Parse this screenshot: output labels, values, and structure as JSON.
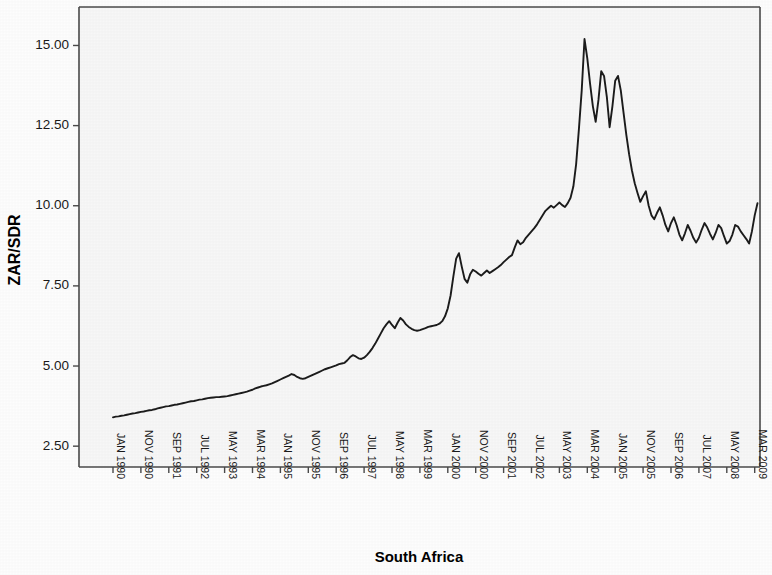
{
  "figure": {
    "background_color": "#fdfdfd",
    "plot_background_color": "#f7f7f7",
    "frame_color": "#4a4a4a",
    "line_color": "#1c1c1c"
  },
  "chart_data": {
    "type": "line",
    "title": "",
    "subtitle": "",
    "xlabel": "South Africa",
    "ylabel": "ZAR/SDR",
    "ylim": [
      1.85,
      16.2
    ],
    "ytick_values": [
      2.5,
      5.0,
      7.5,
      10.0,
      12.5,
      15.0
    ],
    "ytick_labels": [
      "2.50",
      "5.00",
      "7.50",
      "10.00",
      "12.50",
      "15.00"
    ],
    "grid": false,
    "legend": null,
    "legend_position": "none",
    "x_axis_type": "monthly-series",
    "x_tick_interval_months": 10,
    "xtick_labels": [
      "JAN 1990",
      "NOV 1990",
      "SEP 1991",
      "JUL 1992",
      "MAY 1993",
      "MAR 1994",
      "JAN 1995",
      "NOV 1995",
      "SEP 1996",
      "JUL 1997",
      "MAY 1998",
      "MAR 1999",
      "JAN 2000",
      "NOV 2000",
      "SEP 2001",
      "JUL 2002",
      "MAY 2003",
      "MAR 2004",
      "JAN 2005",
      "NOV 2005",
      "SEP 2006",
      "JUL 2007",
      "MAY 2008",
      "MAR 2009"
    ],
    "xtick_label_rotation_deg": 90,
    "series": [
      {
        "name": "ZAR/SDR",
        "start_period": "JAN 1990",
        "period_step_months": 1,
        "values": [
          3.4,
          3.42,
          3.43,
          3.45,
          3.46,
          3.48,
          3.5,
          3.52,
          3.53,
          3.55,
          3.57,
          3.58,
          3.6,
          3.62,
          3.63,
          3.65,
          3.68,
          3.7,
          3.72,
          3.74,
          3.75,
          3.77,
          3.79,
          3.8,
          3.82,
          3.84,
          3.86,
          3.88,
          3.9,
          3.91,
          3.93,
          3.95,
          3.96,
          3.98,
          4.0,
          4.01,
          4.02,
          4.03,
          4.03,
          4.04,
          4.05,
          4.06,
          4.08,
          4.1,
          4.12,
          4.14,
          4.16,
          4.18,
          4.2,
          4.23,
          4.26,
          4.3,
          4.33,
          4.36,
          4.38,
          4.4,
          4.43,
          4.46,
          4.5,
          4.54,
          4.58,
          4.62,
          4.66,
          4.7,
          4.75,
          4.72,
          4.66,
          4.62,
          4.6,
          4.62,
          4.66,
          4.7,
          4.74,
          4.78,
          4.82,
          4.86,
          4.9,
          4.93,
          4.96,
          4.99,
          5.02,
          5.06,
          5.08,
          5.1,
          5.18,
          5.28,
          5.34,
          5.3,
          5.24,
          5.22,
          5.26,
          5.34,
          5.44,
          5.56,
          5.7,
          5.86,
          6.02,
          6.18,
          6.3,
          6.4,
          6.28,
          6.18,
          6.35,
          6.5,
          6.42,
          6.3,
          6.22,
          6.16,
          6.12,
          6.1,
          6.12,
          6.15,
          6.18,
          6.22,
          6.24,
          6.26,
          6.28,
          6.32,
          6.4,
          6.55,
          6.8,
          7.2,
          7.8,
          8.35,
          8.52,
          8.1,
          7.72,
          7.6,
          7.86,
          8.0,
          7.95,
          7.88,
          7.82,
          7.9,
          7.98,
          7.9,
          7.96,
          8.02,
          8.08,
          8.15,
          8.24,
          8.32,
          8.4,
          8.46,
          8.7,
          8.92,
          8.8,
          8.86,
          9.0,
          9.1,
          9.2,
          9.3,
          9.42,
          9.56,
          9.7,
          9.84,
          9.92,
          10.0,
          9.94,
          10.02,
          10.1,
          10.02,
          9.96,
          10.08,
          10.25,
          10.6,
          11.3,
          12.4,
          13.6,
          15.2,
          14.6,
          13.8,
          13.1,
          12.62,
          13.3,
          14.2,
          14.05,
          13.4,
          12.45,
          13.1,
          13.9,
          14.05,
          13.6,
          12.9,
          12.2,
          11.6,
          11.1,
          10.7,
          10.4,
          10.12,
          10.3,
          10.45,
          10.0,
          9.7,
          9.58,
          9.78,
          9.95,
          9.7,
          9.4,
          9.2,
          9.46,
          9.64,
          9.4,
          9.1,
          8.92,
          9.14,
          9.4,
          9.22,
          9.0,
          8.85,
          9.0,
          9.25,
          9.46,
          9.32,
          9.12,
          8.95,
          9.15,
          9.4,
          9.3,
          9.05,
          8.82,
          8.9,
          9.1,
          9.4,
          9.35,
          9.2,
          9.08,
          8.96,
          8.82,
          9.2,
          9.7,
          10.08,
          10.25,
          9.9,
          9.65,
          9.95,
          10.15,
          10.05,
          9.85,
          10.0,
          10.22,
          10.1,
          10.0,
          10.18,
          10.36,
          10.28,
          10.1,
          10.25,
          10.45,
          10.6,
          11.2,
          11.95,
          12.5,
          13.3,
          12.8,
          12.3,
          12.0,
          12.6,
          13.6,
          14.6,
          15.3,
          14.2,
          13.55,
          14.4,
          15.35,
          15.2,
          14.4,
          13.5,
          12.7,
          12.2,
          11.95,
          12.2,
          12.4,
          12.1,
          11.8,
          11.6,
          11.52
        ]
      }
    ],
    "annotations": []
  }
}
